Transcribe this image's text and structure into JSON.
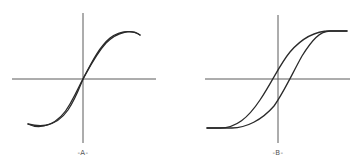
{
  "figure": {
    "panels": [
      {
        "id": "A",
        "label": "-A-",
        "description": "Narrow hysteresis loop (nearly linear S-curve, two closely spaced branches)",
        "curve_type": "narrow-hysteresis-loop"
      },
      {
        "id": "B",
        "label": "-B-",
        "description": "Wide hysteresis loop with saturation at both ends",
        "curve_type": "wide-hysteresis-loop"
      }
    ],
    "colors": {
      "axis": "#5a5a5a",
      "curve": "#2a2a2a",
      "label": "#555555",
      "background": "#ffffff"
    }
  }
}
